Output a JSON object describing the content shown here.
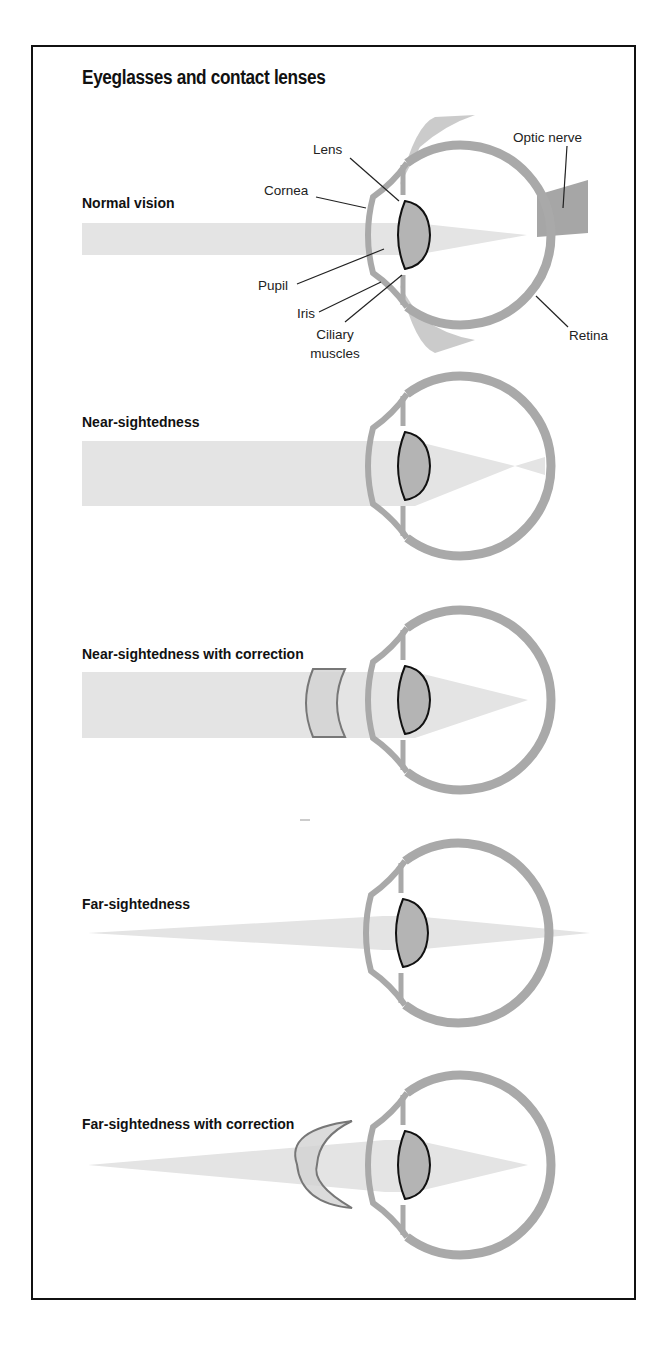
{
  "title": "Eyeglasses and contact lenses",
  "colors": {
    "frame": "#111111",
    "beam": "#e4e4e4",
    "eye_ring": "#a9a9a9",
    "lens_fill": "#b4b4b4",
    "lens_outline": "#111111",
    "optic_nerve": "#a6a6a6",
    "eyelid": "#c2c2c2",
    "corrective_lens_fill": "#d2d2d2",
    "corrective_lens_outline": "#777777",
    "leader_line": "#222222"
  },
  "panels": [
    {
      "id": "normal",
      "label": "Normal vision",
      "label_pos": [
        82,
        208
      ],
      "eye_center": [
        455,
        235
      ],
      "beam": {
        "start_x": 82,
        "top": 223,
        "bottom": 255,
        "focus": [
          527,
          235
        ],
        "cross_to": null
      },
      "corrective_lens": null,
      "show_anatomy": true
    },
    {
      "id": "near",
      "label": "Near-sightedness",
      "label_pos": [
        82,
        427
      ],
      "eye_center": [
        455,
        466
      ],
      "beam": {
        "start_x": 82,
        "top": 441,
        "bottom": 506,
        "focus": [
          515,
          466
        ],
        "cross_to": 545
      },
      "corrective_lens": null,
      "show_anatomy": false
    },
    {
      "id": "near-corrected",
      "label": "Near-sightedness with correction",
      "label_pos": [
        82,
        659
      ],
      "eye_center": [
        455,
        700
      ],
      "beam": {
        "start_x": 82,
        "top": 672,
        "bottom": 738,
        "focus": [
          528,
          700
        ],
        "cross_to": null
      },
      "corrective_lens": {
        "type": "concave",
        "x": 305,
        "top": 669,
        "bottom": 737
      },
      "show_anatomy": false
    },
    {
      "id": "far",
      "label": "Far-sightedness",
      "label_pos": [
        82,
        909
      ],
      "eye_center": [
        453,
        933
      ],
      "beam": {
        "start_x": 88,
        "top": 933,
        "bottom": 933,
        "focus": [
          590,
          933
        ],
        "cross_to": null,
        "mid_top": 916,
        "mid_bottom": 950
      },
      "corrective_lens": null,
      "show_anatomy": false
    },
    {
      "id": "far-corrected",
      "label": "Far-sightedness with correction",
      "label_pos": [
        82,
        1129
      ],
      "eye_center": [
        455,
        1165
      ],
      "beam": {
        "start_x": 88,
        "top": 1165,
        "bottom": 1165,
        "focus": [
          528,
          1165
        ],
        "cross_to": null,
        "mid_top": 1140,
        "mid_bottom": 1192
      },
      "corrective_lens": {
        "type": "convex",
        "x": 297,
        "top": 1121,
        "bottom": 1208
      },
      "show_anatomy": false
    }
  ],
  "anatomy_labels": [
    {
      "text": "Lens",
      "pos": [
        313,
        154
      ],
      "anchor": "start",
      "line": [
        [
          350,
          158
        ],
        [
          399,
          201
        ]
      ]
    },
    {
      "text": "Cornea",
      "pos": [
        264,
        195
      ],
      "anchor": "start",
      "line": [
        [
          316,
          197
        ],
        [
          366,
          208
        ]
      ]
    },
    {
      "text": "Pupil",
      "pos": [
        258,
        290
      ],
      "anchor": "start",
      "line": [
        [
          297,
          284
        ],
        [
          384,
          249
        ]
      ]
    },
    {
      "text": "Iris",
      "pos": [
        297,
        318
      ],
      "anchor": "start",
      "line": [
        [
          319,
          312
        ],
        [
          381,
          282
        ]
      ]
    },
    {
      "text": "Ciliary",
      "pos": [
        335,
        339
      ],
      "anchor": "middle",
      "line": [
        [
          345,
          322
        ],
        [
          402,
          275
        ]
      ]
    },
    {
      "text": "muscles",
      "pos": [
        335,
        358
      ],
      "anchor": "middle",
      "line": null
    },
    {
      "text": "Optic nerve",
      "pos": [
        513,
        142
      ],
      "anchor": "start",
      "line": [
        [
          567,
          146
        ],
        [
          563,
          208
        ]
      ]
    },
    {
      "text": "Retina",
      "pos": [
        569,
        340
      ],
      "anchor": "start",
      "line": [
        [
          568,
          327
        ],
        [
          536,
          296
        ]
      ]
    }
  ],
  "stray_mark": [
    300,
    820
  ],
  "bottom_text": "cut-off text below frame"
}
